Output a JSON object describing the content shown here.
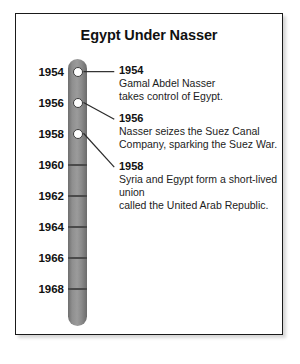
{
  "card": {
    "title": "Egypt Under Nasser"
  },
  "timeline": {
    "axis_years": [
      "1954",
      "1956",
      "1958",
      "1960",
      "1962",
      "1964",
      "1966",
      "1968"
    ],
    "bar_color_light": "#9b9b9b",
    "bar_color_dark": "#6b6b6b",
    "marker_fill": "#ffffff",
    "marker_stroke": "#3c3c3c"
  },
  "events": [
    {
      "year": "1954",
      "description": "Gamal Abdel Nasser\ntakes control of Egypt."
    },
    {
      "year": "1956",
      "description": "Nasser seizes the Suez Canal\nCompany, sparking the Suez War."
    },
    {
      "year": "1958",
      "description": "Syria and Egypt form a short-lived union\ncalled the United Arab Republic."
    }
  ],
  "chart_data": {
    "type": "timeline",
    "title": "Egypt Under Nasser",
    "orientation": "vertical",
    "axis_label": "",
    "axis_range": [
      "1954",
      "1968"
    ],
    "tick_interval_years": 2,
    "tick_labels": [
      "1954",
      "1956",
      "1958",
      "1960",
      "1962",
      "1964",
      "1966",
      "1968"
    ],
    "events": [
      {
        "year": 1954,
        "label": "1954",
        "text": "Gamal Abdel Nasser takes control of Egypt.",
        "marked": true
      },
      {
        "year": 1956,
        "label": "1956",
        "text": "Nasser seizes the Suez Canal Company, sparking the Suez War.",
        "marked": true
      },
      {
        "year": 1958,
        "label": "1958",
        "text": "Syria and Egypt form a short-lived union called the United Arab Republic.",
        "marked": true
      }
    ],
    "grid": false,
    "legend": "none"
  }
}
